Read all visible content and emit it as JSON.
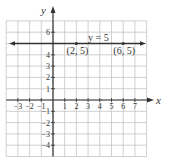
{
  "chart_data": {
    "type": "line",
    "title": "",
    "xlabel": "x",
    "ylabel": "y",
    "xlim": [
      -4,
      8
    ],
    "ylim": [
      -5,
      7
    ],
    "grid": true,
    "x_tick_labels": [
      "−3",
      "−2",
      "−1",
      "1",
      "2",
      "3",
      "4",
      "5",
      "6",
      "7"
    ],
    "y_tick_labels": [
      "6",
      "4",
      "3",
      "2",
      "1",
      "−1",
      "−2",
      "−3",
      "−4"
    ],
    "series": [
      {
        "name": "y = 5",
        "equation": "y = 5",
        "type": "horizontal-line",
        "y": 5,
        "x_extent": [
          -4,
          8
        ],
        "arrows": "both"
      }
    ],
    "points": [
      {
        "label": "(2, 5)",
        "x": 2,
        "y": 5
      },
      {
        "label": "(6, 5)",
        "x": 6,
        "y": 5
      }
    ],
    "annotations": [
      {
        "text": "y = 5",
        "x": 4.5,
        "y": 5.6
      }
    ]
  },
  "colors": {
    "grid": "#bdbdbd",
    "axis": "#333333",
    "line": "#333333",
    "text": "#333333"
  }
}
